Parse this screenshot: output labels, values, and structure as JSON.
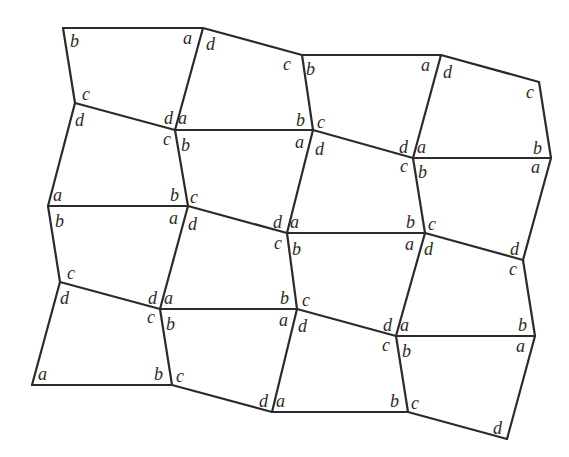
{
  "diagram": {
    "vertices": {
      "A": [
        63,
        28
      ],
      "B": [
        203,
        28
      ],
      "C": [
        302,
        55
      ],
      "D": [
        441,
        55
      ],
      "E": [
        539,
        82
      ],
      "F": [
        75,
        103
      ],
      "G": [
        175,
        130
      ],
      "H": [
        313,
        130
      ],
      "I": [
        413,
        158
      ],
      "J": [
        551,
        158
      ],
      "K": [
        48,
        206
      ],
      "L": [
        188,
        206
      ],
      "M": [
        287,
        233
      ],
      "N": [
        425,
        233
      ],
      "O": [
        523,
        260
      ],
      "P": [
        60,
        282
      ],
      "Q": [
        160,
        309
      ],
      "R": [
        297,
        309
      ],
      "S": [
        396,
        336
      ],
      "T": [
        535,
        336
      ],
      "U": [
        32,
        385
      ],
      "V": [
        172,
        385
      ],
      "W": [
        272,
        412
      ],
      "X": [
        408,
        412
      ],
      "Y": [
        507,
        439
      ]
    },
    "edges": [
      [
        "A",
        "B"
      ],
      [
        "B",
        "C"
      ],
      [
        "C",
        "D"
      ],
      [
        "D",
        "E"
      ],
      [
        "A",
        "F"
      ],
      [
        "B",
        "G"
      ],
      [
        "C",
        "H"
      ],
      [
        "D",
        "I"
      ],
      [
        "E",
        "J"
      ],
      [
        "F",
        "G"
      ],
      [
        "G",
        "H"
      ],
      [
        "H",
        "I"
      ],
      [
        "I",
        "J"
      ],
      [
        "F",
        "K"
      ],
      [
        "G",
        "L"
      ],
      [
        "H",
        "M"
      ],
      [
        "I",
        "N"
      ],
      [
        "J",
        "O"
      ],
      [
        "K",
        "L"
      ],
      [
        "L",
        "M"
      ],
      [
        "M",
        "N"
      ],
      [
        "N",
        "O"
      ],
      [
        "K",
        "P"
      ],
      [
        "L",
        "Q"
      ],
      [
        "M",
        "R"
      ],
      [
        "N",
        "S"
      ],
      [
        "O",
        "T"
      ],
      [
        "P",
        "Q"
      ],
      [
        "Q",
        "R"
      ],
      [
        "R",
        "S"
      ],
      [
        "S",
        "T"
      ],
      [
        "P",
        "U"
      ],
      [
        "Q",
        "V"
      ],
      [
        "R",
        "W"
      ],
      [
        "S",
        "X"
      ],
      [
        "T",
        "Y"
      ],
      [
        "U",
        "V"
      ],
      [
        "V",
        "W"
      ],
      [
        "W",
        "X"
      ],
      [
        "X",
        "Y"
      ]
    ],
    "labels": [
      {
        "t": "b",
        "x": 70,
        "y": 47
      },
      {
        "t": "a",
        "x": 183,
        "y": 44
      },
      {
        "t": "d",
        "x": 206,
        "y": 50
      },
      {
        "t": "c",
        "x": 283,
        "y": 70
      },
      {
        "t": "b",
        "x": 306,
        "y": 75
      },
      {
        "t": "a",
        "x": 421,
        "y": 71
      },
      {
        "t": "d",
        "x": 443,
        "y": 78
      },
      {
        "t": "c",
        "x": 526,
        "y": 98
      },
      {
        "t": "c",
        "x": 82,
        "y": 100
      },
      {
        "t": "d",
        "x": 75,
        "y": 126
      },
      {
        "t": "d",
        "x": 164,
        "y": 124
      },
      {
        "t": "a",
        "x": 178,
        "y": 124
      },
      {
        "t": "c",
        "x": 163,
        "y": 145
      },
      {
        "t": "b",
        "x": 181,
        "y": 151
      },
      {
        "t": "b",
        "x": 296,
        "y": 126
      },
      {
        "t": "c",
        "x": 317,
        "y": 128
      },
      {
        "t": "a",
        "x": 295,
        "y": 148
      },
      {
        "t": "d",
        "x": 315,
        "y": 155
      },
      {
        "t": "d",
        "x": 399,
        "y": 153
      },
      {
        "t": "a",
        "x": 417,
        "y": 153
      },
      {
        "t": "b",
        "x": 533,
        "y": 154
      },
      {
        "t": "c",
        "x": 400,
        "y": 172
      },
      {
        "t": "b",
        "x": 418,
        "y": 178
      },
      {
        "t": "a",
        "x": 531,
        "y": 173
      },
      {
        "t": "a",
        "x": 53,
        "y": 201
      },
      {
        "t": "b",
        "x": 170,
        "y": 201
      },
      {
        "t": "c",
        "x": 190,
        "y": 203
      },
      {
        "t": "b",
        "x": 55,
        "y": 227
      },
      {
        "t": "a",
        "x": 169,
        "y": 224
      },
      {
        "t": "d",
        "x": 188,
        "y": 230
      },
      {
        "t": "d",
        "x": 273,
        "y": 228
      },
      {
        "t": "a",
        "x": 290,
        "y": 228
      },
      {
        "t": "b",
        "x": 406,
        "y": 228
      },
      {
        "t": "c",
        "x": 428,
        "y": 230
      },
      {
        "t": "c",
        "x": 274,
        "y": 249
      },
      {
        "t": "b",
        "x": 292,
        "y": 255
      },
      {
        "t": "a",
        "x": 405,
        "y": 250
      },
      {
        "t": "d",
        "x": 424,
        "y": 255
      },
      {
        "t": "d",
        "x": 510,
        "y": 255
      },
      {
        "t": "c",
        "x": 509,
        "y": 275
      },
      {
        "t": "c",
        "x": 67,
        "y": 279
      },
      {
        "t": "d",
        "x": 60,
        "y": 304
      },
      {
        "t": "d",
        "x": 148,
        "y": 304
      },
      {
        "t": "a",
        "x": 164,
        "y": 304
      },
      {
        "t": "c",
        "x": 147,
        "y": 323
      },
      {
        "t": "b",
        "x": 166,
        "y": 330
      },
      {
        "t": "b",
        "x": 280,
        "y": 304
      },
      {
        "t": "c",
        "x": 302,
        "y": 306
      },
      {
        "t": "a",
        "x": 279,
        "y": 326
      },
      {
        "t": "d",
        "x": 298,
        "y": 332
      },
      {
        "t": "d",
        "x": 383,
        "y": 331
      },
      {
        "t": "a",
        "x": 400,
        "y": 331
      },
      {
        "t": "b",
        "x": 518,
        "y": 331
      },
      {
        "t": "c",
        "x": 382,
        "y": 351
      },
      {
        "t": "b",
        "x": 402,
        "y": 357
      },
      {
        "t": "a",
        "x": 516,
        "y": 352
      },
      {
        "t": "a",
        "x": 38,
        "y": 380
      },
      {
        "t": "b",
        "x": 154,
        "y": 380
      },
      {
        "t": "c",
        "x": 176,
        "y": 382
      },
      {
        "t": "d",
        "x": 259,
        "y": 407
      },
      {
        "t": "a",
        "x": 276,
        "y": 407
      },
      {
        "t": "b",
        "x": 390,
        "y": 407
      },
      {
        "t": "c",
        "x": 411,
        "y": 409
      },
      {
        "t": "d",
        "x": 493,
        "y": 434
      }
    ]
  }
}
